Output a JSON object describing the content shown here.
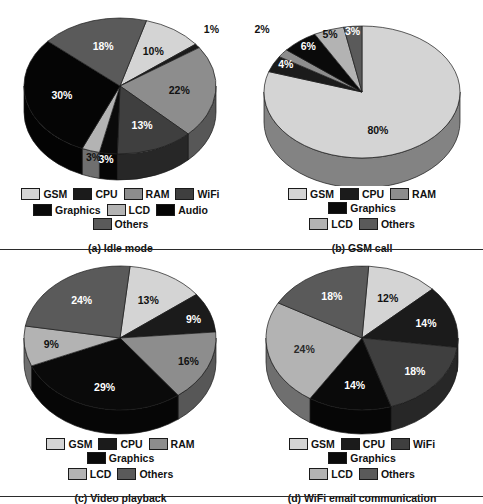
{
  "figure": {
    "type": "figure-of-pie-charts",
    "panel_count": 4,
    "divider_lines": 2
  },
  "palette": {
    "gsm": "#d4d4d4",
    "cpu": "#1b1b1b",
    "ram": "#8d8d8d",
    "wifi": "#3f3f3f",
    "graphics": "#0a0a0a",
    "lcd": "#b3b3b3",
    "audio": "#050505",
    "others": "#5a5a5a",
    "side_dark": "#2e2e2e",
    "outline": "#1a1a1a",
    "label_light": "#ffffff",
    "label_dark": "#111111"
  },
  "charts": [
    {
      "id": "idle-mode",
      "caption": "(a) Idle mode",
      "legend_rows": [
        [
          "GSM",
          "CPU",
          "RAM",
          "WiFi"
        ],
        [
          "Graphics",
          "LCD",
          "Audio",
          "Others"
        ]
      ],
      "chart_data": {
        "type": "pie",
        "title": "(a) Idle mode",
        "categories": [
          "GSM",
          "CPU",
          "RAM",
          "WiFi",
          "Graphics",
          "LCD",
          "Audio",
          "Others"
        ],
        "values": [
          10,
          1,
          22,
          13,
          3,
          3,
          30,
          18
        ],
        "value_labels": [
          "10%",
          "1%",
          "22%",
          "13%",
          "3%",
          "3%",
          "30%",
          "18%"
        ],
        "unit": "%",
        "legend_position": "bottom",
        "grid": false,
        "three_d": true
      }
    },
    {
      "id": "gsm-call",
      "caption": "(b) GSM call",
      "legend_rows": [
        [
          "GSM",
          "CPU",
          "RAM",
          "Graphics"
        ],
        [
          "LCD",
          "Others"
        ]
      ],
      "chart_data": {
        "type": "pie",
        "title": "(b) GSM call",
        "categories": [
          "GSM",
          "CPU",
          "RAM",
          "Graphics",
          "LCD",
          "Others"
        ],
        "values": [
          80,
          4,
          2,
          6,
          5,
          3
        ],
        "value_labels": [
          "80%",
          "4%",
          "2%",
          "6%",
          "5%",
          "3%"
        ],
        "unit": "%",
        "legend_position": "bottom",
        "grid": false,
        "three_d": true
      }
    },
    {
      "id": "video-playback",
      "caption": "(c) Video playback",
      "legend_rows": [
        [
          "GSM",
          "CPU",
          "RAM",
          "Graphics"
        ],
        [
          "LCD",
          "Others"
        ]
      ],
      "chart_data": {
        "type": "pie",
        "title": "(c) Video playback",
        "categories": [
          "GSM",
          "CPU",
          "RAM",
          "Graphics",
          "LCD",
          "Others"
        ],
        "values": [
          13,
          9,
          16,
          29,
          9,
          24
        ],
        "value_labels": [
          "13%",
          "9%",
          "16%",
          "29%",
          "9%",
          "24%"
        ],
        "unit": "%",
        "legend_position": "bottom",
        "grid": false,
        "three_d": true
      }
    },
    {
      "id": "wifi-email-communication",
      "caption": "(d) WiFi email communication",
      "legend_rows": [
        [
          "GSM",
          "CPU",
          "WiFi",
          "Graphics"
        ],
        [
          "LCD",
          "Others"
        ]
      ],
      "chart_data": {
        "type": "pie",
        "title": "(d) WiFi email communication",
        "categories": [
          "GSM",
          "CPU",
          "WiFi",
          "Graphics",
          "LCD",
          "Others"
        ],
        "values": [
          12,
          14,
          18,
          14,
          24,
          18
        ],
        "value_labels": [
          "12%",
          "14%",
          "18%",
          "14%",
          "24%",
          "18%"
        ],
        "unit": "%",
        "legend_position": "bottom",
        "grid": false,
        "three_d": true
      }
    }
  ]
}
